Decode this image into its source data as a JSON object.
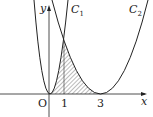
{
  "diagram": {
    "axes": {
      "x_label": "x",
      "y_label": "y",
      "origin_label": "O"
    },
    "ticks": [
      "1",
      "3"
    ],
    "curves": [
      {
        "name": "C",
        "sub": "1",
        "equation_hint": "y = a x^2"
      },
      {
        "name": "C",
        "sub": "2",
        "equation_hint": "y = b (x-3)^2"
      }
    ],
    "shaded_region": "between C1, C2 and x-axis from x=0 to x=3",
    "colors": {
      "stroke": "#222222",
      "hatch": "#555555"
    }
  }
}
